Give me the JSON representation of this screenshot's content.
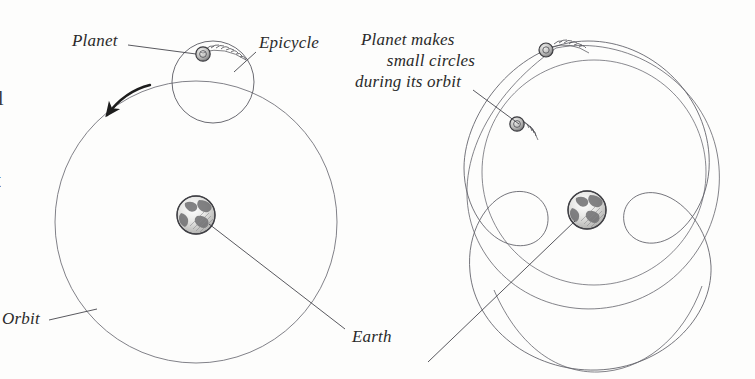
{
  "figure": {
    "title_implicit": "Ptolemaic epicycle model of planetary motion",
    "background_color": "#fdfdfc",
    "ink_color": "#54545a",
    "text_color": "#2a2a2a",
    "panels": [
      {
        "id": "left-panel",
        "name": "epicycle-construction",
        "labels": [
          {
            "key": "planet",
            "text": "Planet"
          },
          {
            "key": "epicycle",
            "text": "Epicycle"
          },
          {
            "key": "orbit",
            "text": "Orbit"
          }
        ],
        "elements": {
          "deferent_circle": "large-orbit-circle",
          "epicycle_circle": "small-circle-on-orbit",
          "earth_globe": "earth-at-center",
          "planet_marker": "small-shaded-planet-disc",
          "direction_arrow": "counter-clockwise-motion-arrow"
        }
      },
      {
        "id": "right-panel",
        "name": "resulting-epitrochoid-path",
        "labels": [
          {
            "key": "annotation_line_1",
            "text": "Planet makes"
          },
          {
            "key": "annotation_line_2",
            "text": "small circles"
          },
          {
            "key": "annotation_line_3",
            "text": "during its orbit"
          }
        ],
        "elements": {
          "epitrochoid_path": "looping-orbit-trace-with-four-loops",
          "earth_globe": "earth-at-center",
          "planet_markers": [
            "planet-on-outer-trace",
            "planet-in-loop"
          ]
        }
      }
    ],
    "shared_labels": [
      {
        "key": "earth",
        "text": "Earth"
      }
    ],
    "edge_fragments": [
      {
        "key": "frag_top",
        "text": "ll"
      },
      {
        "key": "frag_middle",
        "text": "t"
      }
    ]
  }
}
